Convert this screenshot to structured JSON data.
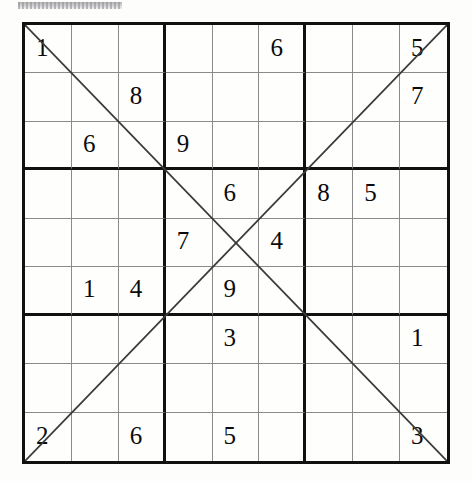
{
  "document": {
    "type": "sudoku-puzzle",
    "variant": "Diagonal Sudoku (Sudoku X)",
    "scan_artifact": ""
  },
  "grid": {
    "rows": 9,
    "columns": 9,
    "box_size": 3,
    "empty_marker": "",
    "colors": {
      "page_background": "#fdfdfc",
      "cell_background": "#fefefd",
      "thin_line": "#8b8b8b",
      "thick_line": "#111111",
      "digit": "#0b0b0b",
      "diagonal_line": "#3a3a3a"
    },
    "diagonals": [
      {
        "name": "main-diagonal",
        "from": "top-left",
        "to": "bottom-right"
      },
      {
        "name": "anti-diagonal",
        "from": "bottom-left",
        "to": "top-right"
      }
    ],
    "cells": [
      [
        "1",
        "",
        "",
        "",
        "",
        "6",
        "",
        "",
        "5"
      ],
      [
        "",
        "",
        "8",
        "",
        "",
        "",
        "",
        "",
        "7"
      ],
      [
        "",
        "6",
        "",
        "9",
        "",
        "",
        "",
        "",
        ""
      ],
      [
        "",
        "",
        "",
        "",
        "6",
        "",
        "8",
        "5",
        ""
      ],
      [
        "",
        "",
        "",
        "7",
        "",
        "4",
        "",
        "",
        ""
      ],
      [
        "",
        "1",
        "4",
        "",
        "9",
        "",
        "",
        "",
        ""
      ],
      [
        "",
        "",
        "",
        "",
        "3",
        "",
        "",
        "",
        "1"
      ],
      [
        "",
        "",
        "",
        "",
        "",
        "",
        "",
        "",
        ""
      ],
      [
        "2",
        "",
        "6",
        "",
        "5",
        "",
        "",
        "",
        "3"
      ]
    ]
  }
}
